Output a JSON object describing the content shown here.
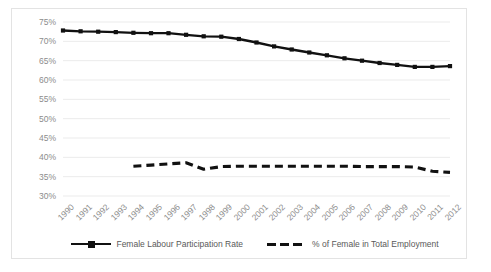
{
  "chart_data": {
    "type": "line",
    "title": "",
    "xlabel": "",
    "ylabel": "",
    "grid": true,
    "legend_position": "bottom",
    "ylim": [
      30,
      75
    ],
    "ytick_labels": [
      "75%",
      "70%",
      "65%",
      "60%",
      "55%",
      "50%",
      "45%",
      "40%",
      "35%",
      "30%"
    ],
    "ytick_values": [
      75,
      70,
      65,
      60,
      55,
      50,
      45,
      40,
      35,
      30
    ],
    "categories": [
      "1990",
      "1991",
      "1992",
      "1993",
      "1994",
      "1995",
      "1996",
      "1997",
      "1998",
      "1999",
      "2000",
      "2001",
      "2002",
      "2003",
      "2004",
      "2005",
      "2006",
      "2007",
      "2008",
      "2009",
      "2010",
      "2011",
      "2012"
    ],
    "series": [
      {
        "name": "Female Labour Participation Rate",
        "style": "solid",
        "marker": "square",
        "color": "#111111",
        "values": [
          72.8,
          72.6,
          72.5,
          72.4,
          72.2,
          72.1,
          72.1,
          71.7,
          71.3,
          71.2,
          70.6,
          69.7,
          68.7,
          67.9,
          67.1,
          66.4,
          65.6,
          65.0,
          64.4,
          63.9,
          63.4,
          63.4,
          63.6
        ]
      },
      {
        "name": "% of Female in Total Employment",
        "style": "dashed",
        "marker": "none",
        "color": "#111111",
        "values": [
          null,
          null,
          null,
          null,
          37.7,
          38.0,
          38.3,
          38.6,
          36.9,
          37.6,
          37.7,
          37.7,
          37.7,
          37.7,
          37.7,
          37.7,
          37.7,
          37.6,
          37.6,
          37.6,
          37.5,
          36.4,
          36.1
        ]
      }
    ]
  },
  "legend": {
    "items": [
      {
        "label": "Female Labour Participation Rate",
        "style": "solid"
      },
      {
        "label": "% of Female in Total Employment",
        "style": "dashed"
      }
    ]
  },
  "colors": {
    "series_line": "#111111",
    "gridline": "#ebebeb",
    "axis_text": "#8c8c8c",
    "legend_text": "#595959",
    "frame_border": "#e3e3e3"
  }
}
